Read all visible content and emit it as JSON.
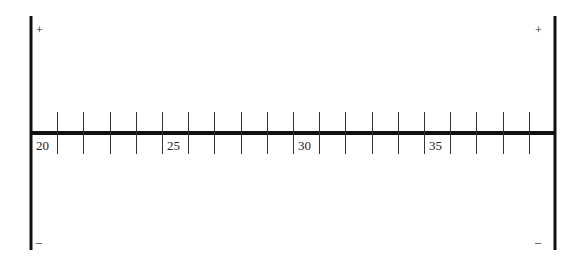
{
  "number_line": {
    "min": 20,
    "max": 40,
    "tick_step": 1,
    "label_step": 5,
    "labels": [
      "20",
      "25",
      "30",
      "35"
    ],
    "axis_color": "#111111",
    "tick_color": "#333333"
  },
  "left_bar": {
    "plus": "+",
    "minus": "–"
  },
  "right_bar": {
    "plus": "+",
    "minus": "–"
  }
}
